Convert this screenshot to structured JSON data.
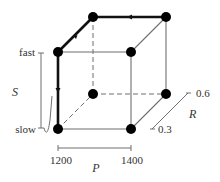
{
  "diagram": {
    "type": "3d-cube-design-space",
    "axes": {
      "S": {
        "name": "S",
        "low_label": "slow",
        "high_label": "fast"
      },
      "P": {
        "name": "P",
        "low_label": "1200",
        "high_label": "1400"
      },
      "R": {
        "name": "R",
        "low_label": "0.3",
        "high_label": "0.6"
      }
    },
    "vertices": [
      {
        "id": "P1200-Slow-R0.3",
        "x": 58,
        "y": 129
      },
      {
        "id": "P1400-Slow-R0.3",
        "x": 131,
        "y": 129
      },
      {
        "id": "P1200-Fast-R0.3",
        "x": 58,
        "y": 52
      },
      {
        "id": "P1400-Fast-R0.3",
        "x": 131,
        "y": 52
      },
      {
        "id": "P1200-Slow-R0.6",
        "x": 93,
        "y": 94
      },
      {
        "id": "P1400-Slow-R0.6",
        "x": 166,
        "y": 94
      },
      {
        "id": "P1200-Fast-R0.6",
        "x": 93,
        "y": 17
      },
      {
        "id": "P1400-Fast-R0.6",
        "x": 166,
        "y": 17
      }
    ],
    "highlighted_path": [
      "P1200-Slow-R0.3",
      "P1200-Fast-R0.3",
      "P1200-Fast-R0.6",
      "P1400-Fast-R0.6"
    ],
    "colors": {
      "edge": "#6f6f6f",
      "bold_path": "#111111",
      "vertex": "#000000",
      "text": "#333333"
    }
  }
}
